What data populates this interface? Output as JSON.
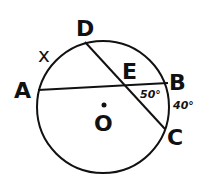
{
  "diagram": {
    "type": "circle-geometry",
    "circle": {
      "center_label": "O",
      "cx": 103,
      "cy": 107,
      "r": 66
    },
    "points": [
      {
        "label": "A",
        "x": 38,
        "y": 90
      },
      {
        "label": "B",
        "x": 168,
        "y": 83
      },
      {
        "label": "C",
        "x": 165,
        "y": 128
      },
      {
        "label": "D",
        "x": 85,
        "y": 42
      },
      {
        "label": "E",
        "x": 125,
        "y": 86
      }
    ],
    "chords": [
      {
        "from": "A",
        "to": "B"
      },
      {
        "from": "D",
        "to": "C"
      }
    ],
    "annotations": {
      "angle_BEC": "50°",
      "arc_BC": "40°",
      "arc_AD": "x"
    },
    "labels": {
      "A": "A",
      "B": "B",
      "C": "C",
      "D": "D",
      "E": "E",
      "O": "O",
      "angle": "50°",
      "arc": "40°",
      "unknown": "x"
    }
  }
}
